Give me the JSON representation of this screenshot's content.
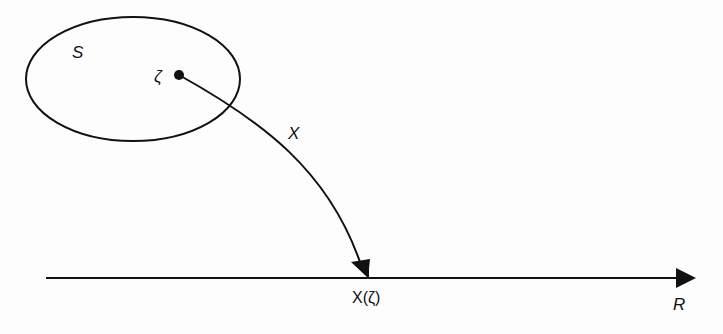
{
  "diagram": {
    "sample_space_label": "S",
    "outcome_label": "ζ",
    "mapping_label": "X",
    "image_label": "X(ζ)",
    "real_line_label": "R"
  },
  "colors": {
    "stroke": "#111111",
    "background": "#fdfdfd"
  }
}
